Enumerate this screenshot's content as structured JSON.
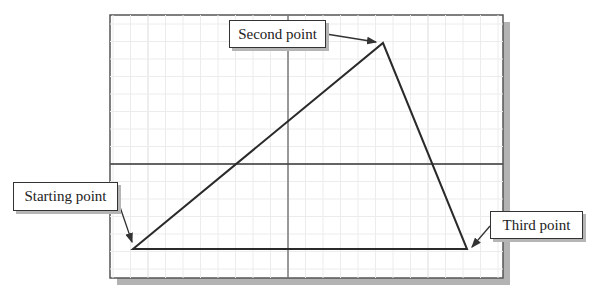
{
  "diagram": {
    "frame": {
      "x": 110,
      "y": 15,
      "width": 393,
      "height": 263
    },
    "shadow_color": "#b0b0b0",
    "grid": {
      "minor_color": "#ececec",
      "major_color": "#dcdcdc",
      "spacing": 17.5
    },
    "axes": {
      "x_axis_y": 164,
      "y_axis_x": 288,
      "color": "#333333"
    },
    "triangle": {
      "color": "#2a2a2a",
      "points": [
        {
          "name": "starting",
          "x": 133,
          "y": 249
        },
        {
          "name": "second",
          "x": 383,
          "y": 43
        },
        {
          "name": "third",
          "x": 467,
          "y": 249
        }
      ]
    },
    "labels": {
      "second_point": "Second point",
      "starting_point": "Starting point",
      "third_point": "Third point"
    }
  }
}
